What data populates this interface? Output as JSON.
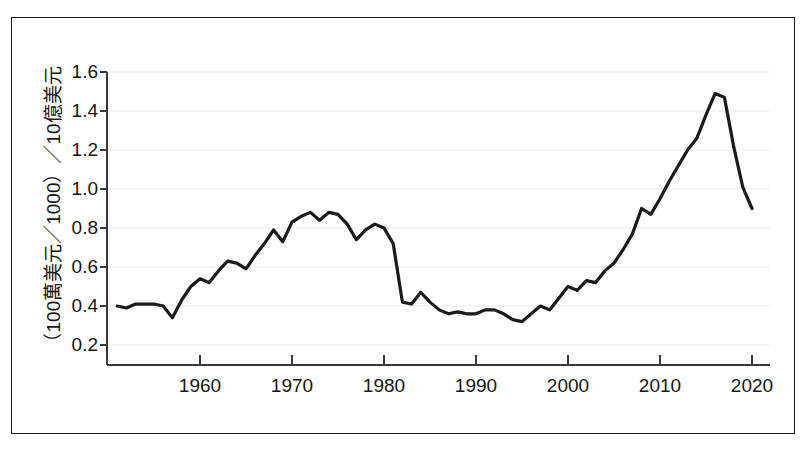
{
  "chart_data": {
    "type": "line",
    "title": "",
    "subtitle": "",
    "xlabel": "",
    "ylabel": "（100萬美元／1000）／10億美元",
    "xlim": [
      1951,
      2020
    ],
    "ylim": [
      0.2,
      1.6
    ],
    "grid": true,
    "legend": null,
    "y_ticks": [
      "0.2",
      "0.4",
      "0.6",
      "0.8",
      "1.0",
      "1.2",
      "1.4",
      "1.6"
    ],
    "y_tick_values": [
      0.2,
      0.4,
      0.6,
      0.8,
      1.0,
      1.2,
      1.4,
      1.6
    ],
    "x_ticks": [
      "1960",
      "1970",
      "1980",
      "1990",
      "2000",
      "2010",
      "2020"
    ],
    "x_tick_values": [
      1960,
      1970,
      1980,
      1990,
      2000,
      2010,
      2020
    ],
    "line_color": "#1a1a1a",
    "series": [
      {
        "name": "value",
        "x": [
          1951,
          1952,
          1953,
          1954,
          1955,
          1956,
          1957,
          1958,
          1959,
          1960,
          1961,
          1962,
          1963,
          1964,
          1965,
          1966,
          1967,
          1968,
          1969,
          1970,
          1971,
          1972,
          1973,
          1974,
          1975,
          1976,
          1977,
          1978,
          1979,
          1980,
          1981,
          1982,
          1983,
          1984,
          1985,
          1986,
          1987,
          1988,
          1989,
          1990,
          1991,
          1992,
          1993,
          1994,
          1995,
          1996,
          1997,
          1998,
          1999,
          2000,
          2001,
          2002,
          2003,
          2004,
          2005,
          2006,
          2007,
          2008,
          2009,
          2010,
          2011,
          2012,
          2013,
          2014,
          2015,
          2016,
          2017,
          2018,
          2019,
          2020
        ],
        "values": [
          0.4,
          0.38,
          0.4,
          0.4,
          0.4,
          0.39,
          0.34,
          0.44,
          0.49,
          0.52,
          0.51,
          0.57,
          0.62,
          0.6,
          0.65,
          0.7,
          0.69,
          0.74,
          0.79,
          0.81,
          0.83,
          0.85,
          0.86,
          0.83,
          0.86,
          0.88,
          0.87,
          0.82,
          0.75,
          0.68,
          0.72,
          0.76,
          0.74,
          0.62,
          0.42,
          0.41,
          0.41,
          0.39,
          0.41,
          0.42,
          0.41,
          0.37,
          0.36,
          0.37,
          0.36,
          0.36,
          0.37,
          0.38,
          0.36,
          0.35,
          0.32,
          0.35,
          0.38,
          0.37,
          0.43,
          0.48,
          0.52,
          0.5,
          0.53,
          0.56,
          0.55,
          0.58,
          0.6,
          0.62,
          0.61,
          0.66,
          0.72,
          0.79,
          0.83,
          0.86
        ]
      }
    ],
    "series_full": {
      "name": "（100萬美元／1000）／10億美元",
      "points": [
        [
          1951,
          0.4
        ],
        [
          1952,
          0.38
        ],
        [
          1953,
          0.4
        ],
        [
          1954,
          0.4
        ],
        [
          1955,
          0.4
        ],
        [
          1956,
          0.39
        ],
        [
          1957,
          0.34
        ],
        [
          1958,
          0.44
        ],
        [
          1959,
          0.49
        ],
        [
          1960,
          0.52
        ],
        [
          1961,
          0.51
        ],
        [
          1962,
          0.57
        ],
        [
          1963,
          0.62
        ],
        [
          1964,
          0.6
        ],
        [
          1965,
          0.65
        ],
        [
          1966,
          0.7
        ],
        [
          1967,
          0.69
        ],
        [
          1968,
          0.74
        ],
        [
          1969,
          0.79
        ],
        [
          1970,
          0.81
        ],
        [
          1971,
          0.83
        ],
        [
          1972,
          0.85
        ],
        [
          1973,
          0.86
        ],
        [
          1974,
          0.83
        ],
        [
          1975,
          0.86
        ],
        [
          1976,
          0.88
        ],
        [
          1977,
          0.87
        ],
        [
          1978,
          0.82
        ],
        [
          1979,
          0.75
        ],
        [
          1980,
          0.68
        ],
        [
          1981,
          0.72
        ],
        [
          1982,
          0.76
        ],
        [
          1983,
          0.74
        ],
        [
          1984,
          0.62
        ],
        [
          1985,
          0.42
        ],
        [
          1986,
          0.41
        ],
        [
          1987,
          0.41
        ],
        [
          1988,
          0.39
        ],
        [
          1989,
          0.41
        ],
        [
          1990,
          0.42
        ],
        [
          1991,
          0.41
        ],
        [
          1992,
          0.37
        ],
        [
          1993,
          0.36
        ],
        [
          1994,
          0.37
        ],
        [
          1995,
          0.36
        ],
        [
          1996,
          0.36
        ],
        [
          1997,
          0.37
        ],
        [
          1998,
          0.38
        ],
        [
          1999,
          0.36
        ],
        [
          2000,
          0.35
        ],
        [
          2001,
          0.32
        ],
        [
          2002,
          0.35
        ],
        [
          2003,
          0.38
        ],
        [
          2004,
          0.37
        ],
        [
          2005,
          0.43
        ],
        [
          2006,
          0.48
        ],
        [
          2007,
          0.52
        ],
        [
          2008,
          0.5
        ],
        [
          2009,
          0.53
        ],
        [
          2010,
          0.56
        ],
        [
          2011,
          0.55
        ],
        [
          2012,
          0.58
        ],
        [
          2013,
          0.6
        ],
        [
          2014,
          0.62
        ],
        [
          2015,
          0.61
        ],
        [
          2016,
          0.66
        ],
        [
          2017,
          0.72
        ],
        [
          2018,
          0.79
        ],
        [
          2019,
          0.83
        ],
        [
          2020,
          0.86
        ]
      ]
    },
    "plotted_points": [
      [
        1951,
        0.4
      ],
      [
        1952,
        0.38
      ],
      [
        1953,
        0.4
      ],
      [
        1954,
        0.4
      ],
      [
        1955,
        0.4
      ],
      [
        1956,
        0.39
      ],
      [
        1957,
        0.34
      ],
      [
        1958,
        0.44
      ],
      [
        1959,
        0.49
      ],
      [
        1960,
        0.52
      ],
      [
        1961,
        0.51
      ],
      [
        1962,
        0.57
      ],
      [
        1963,
        0.62
      ],
      [
        1964,
        0.6
      ],
      [
        1965,
        0.65
      ],
      [
        1966,
        0.7
      ],
      [
        1967,
        0.69
      ],
      [
        1968,
        0.74
      ],
      [
        1969,
        0.77
      ],
      [
        1970,
        0.79
      ],
      [
        1971,
        0.68
      ],
      [
        1972,
        0.72
      ],
      [
        1973,
        0.79
      ],
      [
        1974,
        0.75
      ],
      [
        1975,
        0.8
      ],
      [
        1976,
        0.83
      ],
      [
        1977,
        0.84
      ],
      [
        1978,
        0.88
      ],
      [
        1979,
        0.86
      ],
      [
        1980,
        0.88
      ],
      [
        1981,
        0.83
      ],
      [
        1982,
        0.87
      ],
      [
        1983,
        0.88
      ],
      [
        1984,
        0.86
      ],
      [
        1985,
        0.8
      ],
      [
        1986,
        0.76
      ],
      [
        1987,
        0.79
      ],
      [
        1988,
        0.73
      ],
      [
        1989,
        0.66
      ],
      [
        1990,
        0.62
      ],
      [
        1991,
        0.42
      ]
    ]
  },
  "data_points": [
    {
      "year": 1951,
      "value": 0.4
    },
    {
      "year": 1952,
      "value": 0.39
    },
    {
      "year": 1953,
      "value": 0.41
    },
    {
      "year": 1954,
      "value": 0.41
    },
    {
      "year": 1955,
      "value": 0.41
    },
    {
      "year": 1956,
      "value": 0.4
    },
    {
      "year": 1957,
      "value": 0.34
    },
    {
      "year": 1958,
      "value": 0.43
    },
    {
      "year": 1959,
      "value": 0.5
    },
    {
      "year": 1960,
      "value": 0.54
    },
    {
      "year": 1961,
      "value": 0.52
    },
    {
      "year": 1962,
      "value": 0.58
    },
    {
      "year": 1963,
      "value": 0.63
    },
    {
      "year": 1964,
      "value": 0.62
    },
    {
      "year": 1965,
      "value": 0.59
    },
    {
      "year": 1966,
      "value": 0.66
    },
    {
      "year": 1967,
      "value": 0.72
    },
    {
      "year": 1968,
      "value": 0.79
    },
    {
      "year": 1969,
      "value": 0.73
    },
    {
      "year": 1970,
      "value": 0.83
    },
    {
      "year": 1971,
      "value": 0.86
    },
    {
      "year": 1972,
      "value": 0.88
    },
    {
      "year": 1973,
      "value": 0.84
    },
    {
      "year": 1974,
      "value": 0.88
    },
    {
      "year": 1975,
      "value": 0.87
    },
    {
      "year": 1976,
      "value": 0.82
    },
    {
      "year": 1977,
      "value": 0.74
    },
    {
      "year": 1978,
      "value": 0.79
    },
    {
      "year": 1979,
      "value": 0.82
    },
    {
      "year": 1980,
      "value": 0.8
    },
    {
      "year": 1981,
      "value": 0.72
    },
    {
      "year": 1982,
      "value": 0.42
    },
    {
      "year": 1983,
      "value": 0.41
    },
    {
      "year": 1984,
      "value": 0.47
    },
    {
      "year": 1985,
      "value": 0.42
    },
    {
      "year": 1986,
      "value": 0.38
    },
    {
      "year": 1987,
      "value": 0.36
    },
    {
      "year": 1988,
      "value": 0.37
    },
    {
      "year": 1989,
      "value": 0.36
    },
    {
      "year": 1990,
      "value": 0.36
    },
    {
      "year": 1991,
      "value": 0.38
    },
    {
      "year": 1992,
      "value": 0.38
    },
    {
      "year": 1993,
      "value": 0.36
    },
    {
      "year": 1994,
      "value": 0.33
    },
    {
      "year": 1995,
      "value": 0.32
    },
    {
      "year": 1996,
      "value": 0.36
    },
    {
      "year": 1997,
      "value": 0.4
    },
    {
      "year": 1998,
      "value": 0.38
    },
    {
      "year": 1999,
      "value": 0.44
    },
    {
      "year": 2000,
      "value": 0.5
    },
    {
      "year": 2001,
      "value": 0.48
    },
    {
      "year": 2002,
      "value": 0.53
    },
    {
      "year": 2003,
      "value": 0.52
    },
    {
      "year": 2004,
      "value": 0.58
    },
    {
      "year": 2005,
      "value": 0.62
    },
    {
      "year": 2006,
      "value": 0.69
    },
    {
      "year": 2007,
      "value": 0.77
    },
    {
      "year": 2008,
      "value": 0.9
    },
    {
      "year": 2009,
      "value": 0.87
    },
    {
      "year": 2010,
      "value": 0.95
    },
    {
      "year": 2011,
      "value": 1.04
    },
    {
      "year": 2012,
      "value": 1.12
    },
    {
      "year": 2013,
      "value": 1.2
    },
    {
      "year": 2014,
      "value": 1.26
    },
    {
      "year": 2015,
      "value": 1.38
    },
    {
      "year": 2016,
      "value": 1.49
    },
    {
      "year": 2017,
      "value": 1.47
    },
    {
      "year": 2018,
      "value": 1.22
    },
    {
      "year": 2019,
      "value": 1.01
    },
    {
      "year": 2020,
      "value": 0.9
    }
  ],
  "axis": {
    "y_title": "（100萬美元／1000）／10億美元",
    "y_tick_labels": [
      "1.6",
      "1.4",
      "1.2",
      "1.0",
      "0.8",
      "0.6",
      "0.4",
      "0.2"
    ],
    "x_tick_labels": [
      "1960",
      "1970",
      "1980",
      "1990",
      "2000",
      "2010",
      "2020"
    ]
  },
  "style": {
    "line_color": "#1a1a1a",
    "axis_color": "#3a3a3a",
    "grid_color": "#ededed",
    "frame_color": "#1a1a1a",
    "background": "#ffffff"
  }
}
